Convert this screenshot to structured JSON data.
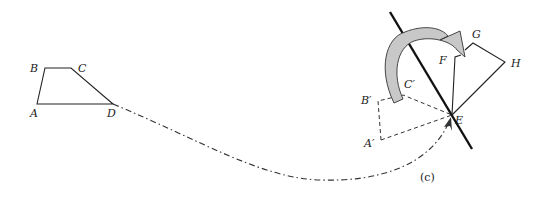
{
  "figure": {
    "caption": "(c)"
  },
  "original_shape": {
    "labels": {
      "A": "A",
      "B": "B",
      "C": "C",
      "D": "D"
    }
  },
  "translated_shape": {
    "labels": {
      "A": "A′",
      "B": "B′",
      "C": "C′",
      "E": "E"
    }
  },
  "reflected_shape": {
    "labels": {
      "F": "F",
      "G": "G",
      "H": "H"
    }
  },
  "colors": {
    "stroke": "#222222",
    "dashed": "#333333",
    "arrow_fill": "#c8c8c8",
    "background": "#ffffff"
  }
}
